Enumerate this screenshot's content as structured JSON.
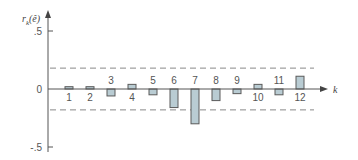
{
  "chart_data": {
    "type": "bar",
    "title": "",
    "xlabel": "k",
    "ylabel": "r_k(ê)",
    "categories": [
      "1",
      "2",
      "3",
      "4",
      "5",
      "6",
      "7",
      "8",
      "9",
      "10",
      "11",
      "12"
    ],
    "values": [
      0.02,
      0.02,
      -0.06,
      0.04,
      -0.05,
      -0.16,
      -0.3,
      -0.1,
      -0.04,
      0.04,
      -0.05,
      0.11
    ],
    "ylim": [
      -0.5,
      0.5
    ],
    "yticks": [
      0.5,
      0,
      -0.5
    ],
    "ytick_labels": [
      ".5",
      "0",
      "-.5"
    ],
    "confidence_bounds": [
      0.18,
      -0.18
    ],
    "grid": false,
    "legend": null,
    "colors": {
      "bar_fill": "#b9ccd3",
      "bar_stroke": "#5a5a5a",
      "axis": "#555555",
      "bounds": "#888888"
    }
  }
}
